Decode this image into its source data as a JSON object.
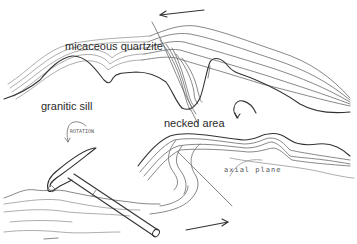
{
  "diagram": {
    "title": "",
    "labels": {
      "micaceous_quartzite": "micaceous quartzite",
      "granitic_sill": "granitic sill",
      "necked_area": "necked area",
      "axial_plane": "axial plane",
      "rotation": "ROTATION"
    },
    "elements": [
      {
        "id": "upper-fold",
        "desc": "folded micaceous quartzite layers, tight fold with necked hinge"
      },
      {
        "id": "lower-fold",
        "desc": "folded strata with axial plane trace"
      },
      {
        "id": "hammer",
        "desc": "geological hammer for scale"
      },
      {
        "id": "shear-arrow-top",
        "desc": "sense of shear arrow pointing left"
      },
      {
        "id": "shear-arrow-bottom",
        "desc": "sense of shear arrow pointing right"
      },
      {
        "id": "rotation-arrow-left",
        "desc": "curved rotation arrow"
      },
      {
        "id": "rotation-arrow-right",
        "desc": "curved rotation arrow"
      }
    ],
    "colors": {
      "line": "#333333",
      "light_line": "#8a8a8a",
      "background": "#ffffff"
    }
  }
}
